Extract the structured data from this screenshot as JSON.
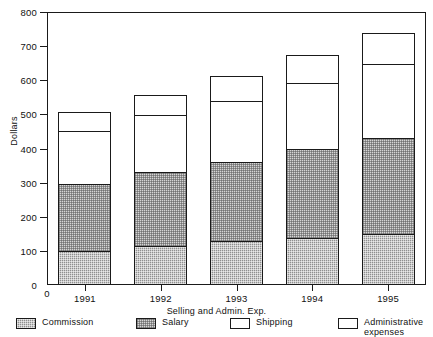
{
  "chart_data": {
    "type": "bar",
    "subtype": "stacked-bar",
    "title": "",
    "xlabel": "Selling and Admin. Exp.",
    "ylabel": "Dollars",
    "categories": [
      "1991",
      "1992",
      "1993",
      "1994",
      "1995"
    ],
    "ylim": [
      0,
      800
    ],
    "yticks": [
      0,
      100,
      200,
      300,
      400,
      500,
      600,
      700,
      800
    ],
    "ytick_labels": [
      "0",
      "100",
      "200",
      "300",
      "400",
      "500",
      "600",
      "700",
      "800"
    ],
    "origin_label": "0",
    "grid": false,
    "legend_position": "bottom",
    "series": [
      {
        "name": "Commission",
        "fill": "commission",
        "color": "#8f8f8f",
        "values": [
          100,
          115,
          130,
          138,
          150
        ]
      },
      {
        "name": "Salary",
        "fill": "salary",
        "color": "#d5d5d5",
        "values": [
          200,
          220,
          235,
          265,
          285
        ]
      },
      {
        "name": "Shipping",
        "fill": "shipping",
        "color": "#ffffff",
        "values": [
          160,
          172,
          185,
          198,
          222
        ]
      },
      {
        "name": "Administrative\nexpenses",
        "fill": "admin",
        "color": "#ffffff",
        "values": [
          60,
          63,
          75,
          84,
          93
        ]
      }
    ],
    "stack_tops": {
      "1991": [
        100,
        300,
        460,
        520
      ],
      "1992": [
        115,
        335,
        507,
        570
      ],
      "1993": [
        130,
        365,
        550,
        625
      ],
      "1994": [
        138,
        403,
        601,
        685
      ],
      "1995": [
        150,
        435,
        657,
        750
      ]
    },
    "totals": [
      520,
      570,
      625,
      685,
      750
    ]
  },
  "legend": {
    "items": [
      {
        "label": "Commission",
        "fill": "commission"
      },
      {
        "label": "Salary",
        "fill": "salary"
      },
      {
        "label": "Shipping",
        "fill": "shipping"
      },
      {
        "label": "Administrative\nexpenses",
        "fill": "admin"
      }
    ]
  },
  "axis": {
    "y_title": "Dollars",
    "x_title": "Selling and Admin. Exp."
  }
}
